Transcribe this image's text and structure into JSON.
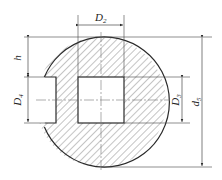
{
  "diagram": {
    "type": "technical-drawing-section",
    "colors": {
      "line": "#2a2a2a",
      "hatch": "#555555",
      "background": "#ffffff"
    },
    "labels": {
      "D2": {
        "main": "D",
        "sub": "2"
      },
      "h": {
        "main": "h"
      },
      "D4": {
        "main": "D",
        "sub": "4"
      },
      "D3": {
        "main": "D",
        "sub": "3"
      },
      "d5": {
        "main": "d",
        "sub": "5"
      }
    }
  }
}
